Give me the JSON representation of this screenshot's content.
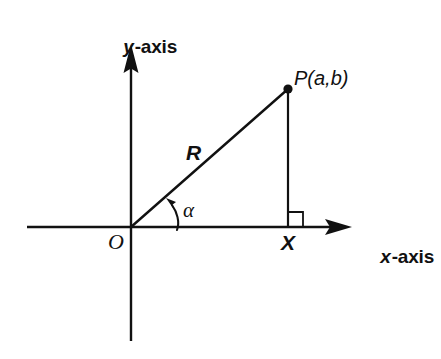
{
  "figure": {
    "type": "geometry-diagram",
    "background_color": "#ffffff",
    "stroke_color": "#111111"
  },
  "axes": {
    "x": {
      "name_variable": "x",
      "name_suffix": "-axis",
      "label": "x-axis",
      "origin_px": [
        131,
        227
      ],
      "start_px": [
        27,
        227
      ],
      "arrow_tip_px": [
        352,
        227
      ],
      "has_arrow": true
    },
    "y": {
      "name_variable": "y",
      "name_suffix": "-axis",
      "label": "y-axis",
      "arrow_tip_px": [
        131,
        44
      ],
      "end_px": [
        131,
        341
      ],
      "has_arrow": true
    }
  },
  "points": [
    {
      "id": "origin",
      "label": "O",
      "px": [
        131,
        227
      ],
      "dot": false
    },
    {
      "id": "point-p",
      "label": "P(a,b)",
      "px": [
        288,
        89
      ],
      "dot": true
    },
    {
      "id": "foot-x",
      "label": "X",
      "px": [
        288,
        227
      ],
      "dot": false
    }
  ],
  "segments": [
    {
      "id": "hypotenuse",
      "label": "R",
      "from": "origin",
      "to": "point-p"
    },
    {
      "id": "perpendicular",
      "label": "",
      "from": "point-p",
      "to": "foot-x"
    }
  ],
  "angle": {
    "id": "angle-alpha",
    "label": "α",
    "vertex": "origin",
    "between": [
      "x-axis",
      "hypotenuse"
    ],
    "marker": "curved-arrow"
  },
  "right_angle": {
    "at": "foot-x",
    "marker": "square",
    "size_px": 15,
    "side": "right"
  }
}
